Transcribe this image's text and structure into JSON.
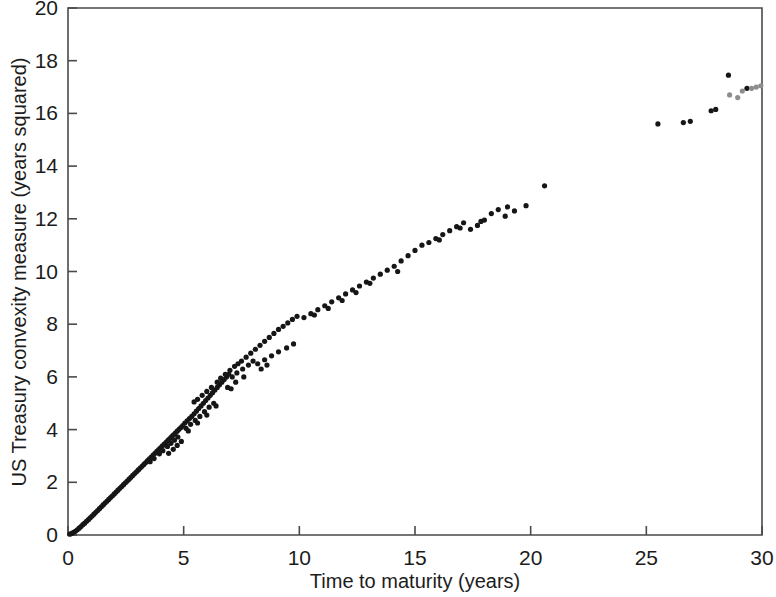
{
  "chart_data": {
    "type": "scatter",
    "title": "",
    "subtitle": "",
    "xlabel": "Time to maturity (years)",
    "ylabel": "US Treasury convexity measure (years squared)",
    "xlim": [
      0,
      30
    ],
    "ylim": [
      0,
      20
    ],
    "xticks": [
      0,
      5,
      10,
      15,
      20,
      25,
      30
    ],
    "yticks": [
      0,
      2,
      4,
      6,
      8,
      10,
      12,
      14,
      16,
      18,
      20
    ],
    "grid": false,
    "legend": null,
    "marker": "filled-circle",
    "marker_size_px": 5.2,
    "colors": {
      "primary_marker": "#161616",
      "secondary_marker": "#8d8d8d",
      "axis": "#4a4a4a",
      "text": "#1c1c1c",
      "background": "#ffffff"
    },
    "series": [
      {
        "name": "US Treasury securities",
        "color": "#161616",
        "points": [
          [
            0.08,
            0.03
          ],
          [
            0.16,
            0.06
          ],
          [
            0.24,
            0.1
          ],
          [
            0.32,
            0.14
          ],
          [
            0.4,
            0.2
          ],
          [
            0.48,
            0.26
          ],
          [
            0.56,
            0.32
          ],
          [
            0.64,
            0.39
          ],
          [
            0.72,
            0.45
          ],
          [
            0.8,
            0.52
          ],
          [
            0.88,
            0.58
          ],
          [
            0.96,
            0.65
          ],
          [
            1.04,
            0.72
          ],
          [
            1.12,
            0.79
          ],
          [
            1.2,
            0.86
          ],
          [
            1.28,
            0.93
          ],
          [
            1.36,
            1.0
          ],
          [
            1.44,
            1.07
          ],
          [
            1.52,
            1.14
          ],
          [
            1.6,
            1.21
          ],
          [
            1.68,
            1.28
          ],
          [
            1.76,
            1.35
          ],
          [
            1.84,
            1.42
          ],
          [
            1.92,
            1.49
          ],
          [
            2.0,
            1.56
          ],
          [
            2.08,
            1.63
          ],
          [
            2.16,
            1.7
          ],
          [
            2.24,
            1.77
          ],
          [
            2.32,
            1.84
          ],
          [
            2.4,
            1.91
          ],
          [
            2.48,
            1.98
          ],
          [
            2.56,
            2.05
          ],
          [
            2.64,
            2.12
          ],
          [
            2.72,
            2.19
          ],
          [
            2.8,
            2.26
          ],
          [
            2.88,
            2.33
          ],
          [
            2.96,
            2.4
          ],
          [
            3.04,
            2.47
          ],
          [
            3.12,
            2.54
          ],
          [
            3.2,
            2.61
          ],
          [
            3.28,
            2.68
          ],
          [
            3.36,
            2.75
          ],
          [
            3.44,
            2.82
          ],
          [
            3.52,
            2.89
          ],
          [
            3.6,
            2.96
          ],
          [
            3.68,
            3.03
          ],
          [
            3.76,
            3.1
          ],
          [
            3.84,
            3.17
          ],
          [
            3.92,
            3.24
          ],
          [
            4.0,
            3.31
          ],
          [
            4.08,
            3.38
          ],
          [
            4.16,
            3.45
          ],
          [
            4.24,
            3.52
          ],
          [
            4.32,
            3.59
          ],
          [
            4.4,
            3.66
          ],
          [
            4.48,
            3.73
          ],
          [
            4.56,
            3.8
          ],
          [
            4.64,
            3.87
          ],
          [
            4.72,
            3.94
          ],
          [
            4.8,
            4.01
          ],
          [
            4.88,
            4.08
          ],
          [
            4.96,
            4.15
          ],
          [
            3.55,
            2.78
          ],
          [
            3.72,
            2.9
          ],
          [
            3.95,
            3.08
          ],
          [
            4.1,
            3.2
          ],
          [
            4.3,
            3.36
          ],
          [
            4.45,
            3.48
          ],
          [
            4.6,
            3.6
          ],
          [
            4.75,
            3.72
          ],
          [
            4.35,
            3.1
          ],
          [
            4.55,
            3.25
          ],
          [
            4.72,
            3.4
          ],
          [
            4.9,
            3.55
          ],
          [
            5.05,
            4.25
          ],
          [
            5.15,
            4.33
          ],
          [
            5.25,
            4.42
          ],
          [
            5.35,
            4.5
          ],
          [
            5.45,
            4.6
          ],
          [
            5.55,
            4.7
          ],
          [
            5.65,
            4.8
          ],
          [
            5.75,
            4.9
          ],
          [
            5.85,
            5.0
          ],
          [
            5.95,
            5.1
          ],
          [
            6.05,
            5.2
          ],
          [
            6.15,
            5.3
          ],
          [
            6.25,
            5.4
          ],
          [
            6.35,
            5.5
          ],
          [
            6.45,
            5.6
          ],
          [
            6.55,
            5.7
          ],
          [
            6.65,
            5.8
          ],
          [
            6.75,
            5.9
          ],
          [
            6.85,
            6.0
          ],
          [
            6.95,
            6.1
          ],
          [
            5.1,
            4.05
          ],
          [
            5.3,
            4.2
          ],
          [
            5.5,
            4.35
          ],
          [
            5.7,
            4.5
          ],
          [
            5.9,
            4.68
          ],
          [
            6.1,
            4.85
          ],
          [
            6.3,
            5.0
          ],
          [
            5.2,
            3.95
          ],
          [
            5.6,
            4.25
          ],
          [
            6.0,
            4.55
          ],
          [
            6.4,
            4.9
          ],
          [
            5.45,
            5.05
          ],
          [
            5.6,
            5.15
          ],
          [
            5.8,
            5.3
          ],
          [
            6.0,
            5.45
          ],
          [
            6.2,
            5.6
          ],
          [
            6.45,
            5.8
          ],
          [
            6.6,
            5.95
          ],
          [
            6.8,
            6.1
          ],
          [
            7.0,
            6.25
          ],
          [
            7.2,
            6.4
          ],
          [
            7.35,
            6.5
          ],
          [
            7.5,
            6.6
          ],
          [
            7.7,
            6.75
          ],
          [
            7.9,
            6.9
          ],
          [
            8.1,
            7.05
          ],
          [
            8.3,
            7.2
          ],
          [
            8.5,
            7.35
          ],
          [
            8.7,
            7.5
          ],
          [
            8.9,
            7.65
          ],
          [
            9.1,
            7.8
          ],
          [
            9.3,
            7.92
          ],
          [
            9.5,
            8.05
          ],
          [
            9.7,
            8.18
          ],
          [
            9.9,
            8.3
          ],
          [
            7.1,
            6.0
          ],
          [
            7.3,
            6.15
          ],
          [
            7.55,
            6.3
          ],
          [
            7.8,
            6.45
          ],
          [
            8.0,
            6.6
          ],
          [
            6.9,
            5.6
          ],
          [
            7.25,
            5.8
          ],
          [
            7.6,
            6.0
          ],
          [
            7.05,
            5.55
          ],
          [
            8.2,
            6.5
          ],
          [
            8.5,
            6.65
          ],
          [
            8.8,
            6.8
          ],
          [
            9.1,
            6.95
          ],
          [
            9.45,
            7.1
          ],
          [
            9.75,
            7.25
          ],
          [
            8.35,
            6.3
          ],
          [
            8.6,
            6.45
          ],
          [
            10.2,
            8.25
          ],
          [
            10.5,
            8.4
          ],
          [
            10.8,
            8.55
          ],
          [
            11.1,
            8.7
          ],
          [
            11.4,
            8.85
          ],
          [
            11.7,
            9.0
          ],
          [
            12.0,
            9.15
          ],
          [
            12.3,
            9.3
          ],
          [
            12.6,
            9.45
          ],
          [
            12.9,
            9.6
          ],
          [
            13.2,
            9.75
          ],
          [
            13.5,
            9.9
          ],
          [
            13.8,
            10.05
          ],
          [
            14.1,
            10.2
          ],
          [
            14.4,
            10.4
          ],
          [
            14.7,
            10.6
          ],
          [
            15.0,
            10.8
          ],
          [
            15.3,
            11.0
          ],
          [
            15.6,
            11.1
          ],
          [
            15.9,
            11.25
          ],
          [
            16.2,
            11.4
          ],
          [
            16.5,
            11.55
          ],
          [
            16.8,
            11.7
          ],
          [
            17.1,
            11.85
          ],
          [
            17.4,
            11.6
          ],
          [
            17.7,
            11.75
          ],
          [
            18.0,
            11.95
          ],
          [
            18.3,
            12.2
          ],
          [
            18.6,
            12.35
          ],
          [
            18.9,
            12.1
          ],
          [
            19.3,
            12.3
          ],
          [
            19.8,
            12.5
          ],
          [
            20.6,
            13.25
          ],
          [
            14.25,
            10.0
          ],
          [
            13.05,
            9.55
          ],
          [
            12.45,
            9.2
          ],
          [
            11.85,
            8.9
          ],
          [
            11.25,
            8.6
          ],
          [
            10.65,
            8.35
          ],
          [
            16.05,
            11.2
          ],
          [
            16.95,
            11.65
          ],
          [
            17.85,
            11.9
          ],
          [
            19.0,
            12.45
          ],
          [
            25.5,
            15.6
          ],
          [
            26.6,
            15.65
          ],
          [
            26.9,
            15.7
          ],
          [
            27.8,
            16.1
          ],
          [
            28.0,
            16.15
          ],
          [
            28.55,
            17.45
          ],
          [
            29.35,
            16.95
          ]
        ]
      },
      {
        "name": "Long-maturity cluster (lighter markers)",
        "color": "#8d8d8d",
        "points": [
          [
            28.6,
            16.7
          ],
          [
            28.95,
            16.6
          ],
          [
            29.15,
            16.85
          ],
          [
            29.55,
            16.95
          ],
          [
            29.75,
            17.0
          ],
          [
            29.95,
            17.05
          ]
        ]
      }
    ]
  },
  "axes": {
    "x_title": "Time to maturity (years)",
    "y_title": "US Treasury convexity measure (years squared)",
    "x_tick_labels": [
      "0",
      "5",
      "10",
      "15",
      "20",
      "25",
      "30"
    ],
    "y_tick_labels": [
      "0",
      "2",
      "4",
      "6",
      "8",
      "10",
      "12",
      "14",
      "16",
      "18",
      "20"
    ]
  }
}
